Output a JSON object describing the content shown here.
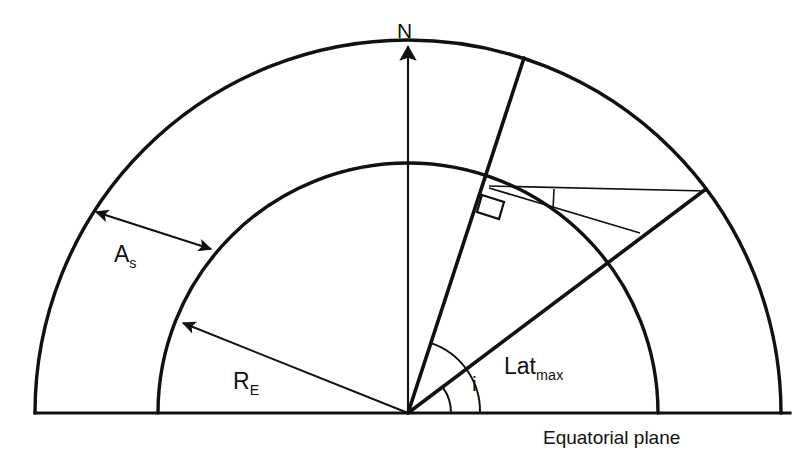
{
  "figure": {
    "background_color": "#ffffff",
    "stroke_color": "#111111",
    "width": 806,
    "height": 464
  },
  "labels": {
    "north_pole": "N",
    "altitude_base": "A",
    "altitude_sub": "s",
    "earth_radius_base": "R",
    "earth_radius_sub": "E",
    "inclination": "i",
    "max_latitude_base": "Lat",
    "max_latitude_sub": "max",
    "equatorial_plane": "Equatorial plane"
  },
  "geometry": {
    "center": {
      "x": 408,
      "y": 413
    },
    "outer_arc_radius": 373,
    "inner_circle_radius": 250,
    "orbit_ray_angle_deg": 37,
    "latmax_ray_angle_deg": 72,
    "north_axis_angle_deg": 90,
    "baseline": {
      "x1": 35,
      "y1": 413,
      "x2": 790,
      "y2": 413
    },
    "inclination_arc_radius": 43,
    "latmax_arc_radius": 72
  },
  "elements": {
    "outer_arc_name": "satellite-orbit-sphere-arc",
    "inner_circle_name": "earth-surface-arc",
    "north_axis_name": "north-polar-axis",
    "orbit_ray_name": "orbit-inclination-ray",
    "latmax_ray_name": "max-latitude-ray",
    "altitude_arrow_name": "satellite-altitude-arrow",
    "radius_arrow_name": "earth-radius-arrow",
    "right_angle_name": "right-angle-marker",
    "baseline_name": "equatorial-plane-line"
  }
}
